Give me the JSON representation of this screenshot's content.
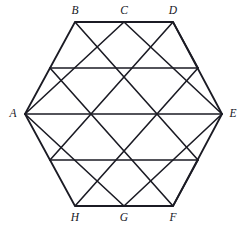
{
  "figure": {
    "kind": "geometry-diagram",
    "background_color": "#ffffff",
    "line_color": "#1b1b24",
    "line_width": 1.6,
    "label_color": "#16161e",
    "canvas": {
      "width": 244,
      "height": 228
    },
    "hexagon": {
      "name": "hexagon-outline",
      "vertices": [
        {
          "id": "B",
          "x": 75,
          "y": 22
        },
        {
          "id": "D",
          "x": 173,
          "y": 22
        },
        {
          "id": "E",
          "x": 222,
          "y": 114
        },
        {
          "id": "F",
          "x": 173,
          "y": 206
        },
        {
          "id": "H",
          "x": 75,
          "y": 206
        },
        {
          "id": "A",
          "x": 25,
          "y": 114
        }
      ]
    },
    "labels": [
      {
        "id": "label-A",
        "text": "A",
        "x": 13,
        "y": 114
      },
      {
        "id": "label-B",
        "text": "B",
        "x": 75,
        "y": 11
      },
      {
        "id": "label-C",
        "text": "C",
        "x": 124,
        "y": 11
      },
      {
        "id": "label-D",
        "text": "D",
        "x": 173,
        "y": 11
      },
      {
        "id": "label-E",
        "text": "E",
        "x": 233,
        "y": 114
      },
      {
        "id": "label-F",
        "text": "F",
        "x": 173,
        "y": 218
      },
      {
        "id": "label-G",
        "text": "G",
        "x": 124,
        "y": 218
      },
      {
        "id": "label-H",
        "text": "H",
        "x": 75,
        "y": 218
      }
    ],
    "grid": {
      "horizontal_lines": [
        {
          "name": "row-line-top",
          "x1": 75,
          "y1": 22,
          "x2": 173,
          "y2": 22
        },
        {
          "name": "row-line-2",
          "x1": 50,
          "y1": 68,
          "x2": 198,
          "y2": 68
        },
        {
          "name": "row-line-middle",
          "x1": 25,
          "y1": 114,
          "x2": 222,
          "y2": 114
        },
        {
          "name": "row-line-4",
          "x1": 50,
          "y1": 160,
          "x2": 198,
          "y2": 160
        },
        {
          "name": "row-line-bottom",
          "x1": 75,
          "y1": 206,
          "x2": 173,
          "y2": 206
        }
      ],
      "diagonal_lines_down_right": [
        {
          "name": "diag-dr-1",
          "x1": 25,
          "y1": 114,
          "x2": 124,
          "y2": 206
        },
        {
          "name": "diag-dr-2",
          "x1": 50,
          "y1": 68,
          "x2": 173,
          "y2": 206
        },
        {
          "name": "diag-dr-3",
          "x1": 75,
          "y1": 22,
          "x2": 198,
          "y2": 160
        },
        {
          "name": "diag-dr-4",
          "x1": 124,
          "y1": 22,
          "x2": 222,
          "y2": 114
        },
        {
          "name": "diag-dr-5",
          "x1": 173,
          "y1": 22,
          "x2": 198,
          "y2": 68
        }
      ],
      "diagonal_lines_up_right": [
        {
          "name": "diag-ur-1",
          "x1": 25,
          "y1": 114,
          "x2": 124,
          "y2": 22
        },
        {
          "name": "diag-ur-2",
          "x1": 50,
          "y1": 160,
          "x2": 173,
          "y2": 22
        },
        {
          "name": "diag-ur-3",
          "x1": 75,
          "y1": 206,
          "x2": 198,
          "y2": 68
        },
        {
          "name": "diag-ur-4",
          "x1": 124,
          "y1": 206,
          "x2": 222,
          "y2": 114
        },
        {
          "name": "diag-ur-5",
          "x1": 173,
          "y1": 206,
          "x2": 198,
          "y2": 160
        }
      ]
    },
    "interior_nodes": [
      {
        "name": "node-r2-1",
        "x": 50,
        "y": 68
      },
      {
        "name": "node-r2-2",
        "x": 99,
        "y": 68
      },
      {
        "name": "node-r2-3",
        "x": 148,
        "y": 68
      },
      {
        "name": "node-r2-4",
        "x": 198,
        "y": 68
      },
      {
        "name": "node-r3-1",
        "x": 75,
        "y": 114
      },
      {
        "name": "node-r3-center",
        "x": 124,
        "y": 114
      },
      {
        "name": "node-r3-3",
        "x": 173,
        "y": 114
      },
      {
        "name": "node-r4-1",
        "x": 50,
        "y": 160
      },
      {
        "name": "node-r4-2",
        "x": 99,
        "y": 160
      },
      {
        "name": "node-r4-3",
        "x": 148,
        "y": 160
      },
      {
        "name": "node-r4-4",
        "x": 198,
        "y": 160
      }
    ]
  }
}
